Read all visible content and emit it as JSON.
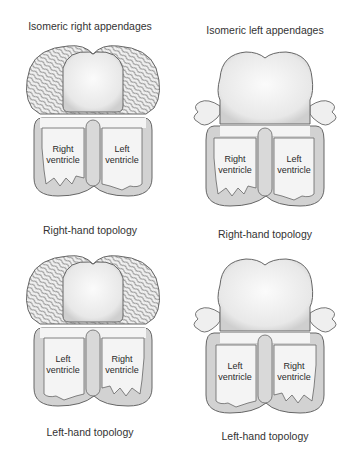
{
  "figure": {
    "columns": [
      {
        "title": "Isomeric right appendages"
      },
      {
        "title": "Isomeric left appendages"
      }
    ],
    "panels": [
      {
        "position": "top-left",
        "appendages": "isomeric right",
        "caption": "Right-hand topology",
        "ventricle_left_side": [
          "Right",
          "ventricle"
        ],
        "ventricle_right_side": [
          "Left",
          "ventricle"
        ]
      },
      {
        "position": "top-right",
        "appendages": "isomeric left",
        "caption": "Right-hand topology",
        "ventricle_left_side": [
          "Right",
          "ventricle"
        ],
        "ventricle_right_side": [
          "Left",
          "ventricle"
        ]
      },
      {
        "position": "bottom-left",
        "appendages": "isomeric right",
        "caption": "Left-hand topology",
        "ventricle_left_side": [
          "Left",
          "ventricle"
        ],
        "ventricle_right_side": [
          "Right",
          "ventricle"
        ]
      },
      {
        "position": "bottom-right",
        "appendages": "isomeric left",
        "caption": "Left-hand topology",
        "ventricle_left_side": [
          "Left",
          "ventricle"
        ],
        "ventricle_right_side": [
          "Right",
          "ventricle"
        ]
      }
    ]
  },
  "colors": {
    "wall": "#d2d2d2",
    "cavity": "#f4f4f4",
    "outline": "#666666",
    "appendage_fill": "#efefef",
    "text": "#333333"
  }
}
